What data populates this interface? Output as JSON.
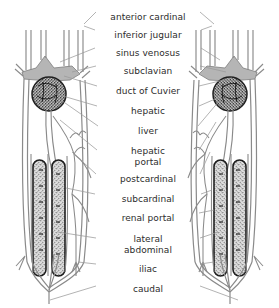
{
  "figure": {
    "colors": {
      "background": "#ffffff",
      "vessel": "#8a8a8a",
      "vessel_dark": "#6f6f6f",
      "organ_outline": "#2a2a2a",
      "organ_fill": "#d8d8d8",
      "sinus_fill": "#b5b5b5",
      "heart_fill": "#4a4a4a",
      "leader": "#9a9a9a",
      "text": "#2c2c2c"
    },
    "labels": [
      {
        "id": "anterior-cardinal",
        "text": "anterior cardinal",
        "x": 148,
        "y": 12,
        "lines": 1
      },
      {
        "id": "inferior-jugular",
        "text": "inferior jugular",
        "x": 148,
        "y": 30,
        "lines": 1
      },
      {
        "id": "sinus-venosus",
        "text": "sinus venosus",
        "x": 148,
        "y": 48,
        "lines": 1
      },
      {
        "id": "subclavian",
        "text": "subclavian",
        "x": 148,
        "y": 66,
        "lines": 1
      },
      {
        "id": "duct-of-cuvier",
        "text": "duct of Cuvier",
        "x": 148,
        "y": 86,
        "lines": 1
      },
      {
        "id": "hepatic",
        "text": "hepatic",
        "x": 148,
        "y": 106,
        "lines": 1
      },
      {
        "id": "liver",
        "text": "liver",
        "x": 148,
        "y": 126,
        "lines": 1
      },
      {
        "id": "hepatic-portal",
        "text": "hepatic\nportal",
        "x": 148,
        "y": 146,
        "lines": 2
      },
      {
        "id": "postcardinal",
        "text": "postcardinal",
        "x": 148,
        "y": 174,
        "lines": 1
      },
      {
        "id": "subcardinal",
        "text": "subcardinal",
        "x": 148,
        "y": 194,
        "lines": 1
      },
      {
        "id": "renal-portal",
        "text": "renal portal",
        "x": 148,
        "y": 213,
        "lines": 1
      },
      {
        "id": "lateral-abdominal",
        "text": "lateral\nabdominal",
        "x": 148,
        "y": 234,
        "lines": 2
      },
      {
        "id": "iliac",
        "text": "iliac",
        "x": 148,
        "y": 264,
        "lines": 1
      },
      {
        "id": "caudal",
        "text": "caudal",
        "x": 148,
        "y": 284,
        "lines": 1
      }
    ]
  }
}
